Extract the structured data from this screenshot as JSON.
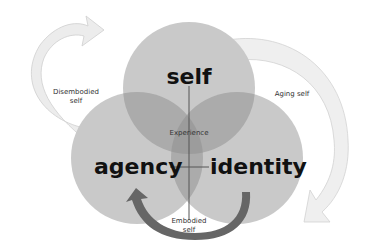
{
  "diagram": {
    "circles": [
      {
        "id": "self",
        "label": "self",
        "cx": 189,
        "cy": 88,
        "r": 66
      },
      {
        "id": "agency",
        "label": "agency",
        "cx": 137,
        "cy": 158,
        "r": 66
      },
      {
        "id": "identity",
        "label": "identity",
        "cx": 237,
        "cy": 158,
        "r": 66
      }
    ],
    "center_label": "Experience",
    "arrows": [
      {
        "id": "disembodied",
        "label_line1": "Disembodied",
        "label_line2": "self",
        "style": "outline-light"
      },
      {
        "id": "aging",
        "label": "Aging self",
        "style": "outline-light"
      },
      {
        "id": "embodied",
        "label_line1": "Embodied",
        "label_line2": "self",
        "style": "solid-dark"
      }
    ],
    "colors": {
      "circle_fill": "#c8c8c8",
      "overlap_fill": "#a8a8a8",
      "center_fill": "#9a9a9a",
      "dark_arrow": "#666666",
      "light_arrow_fill": "#ececec",
      "light_arrow_stroke": "#cfcfcf",
      "axis_line": "#555555"
    }
  }
}
